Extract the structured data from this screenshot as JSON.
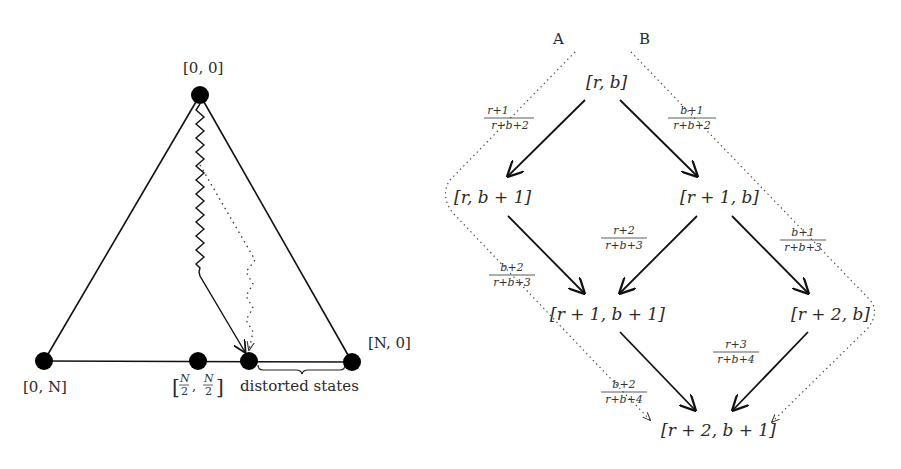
{
  "left_diagram": {
    "title": "Simplex of states",
    "vertices": {
      "top": "[0, 0]",
      "bottom_left": "[0, N]",
      "bottom_right": "[N, 0]",
      "midpoint_num": "N",
      "midpoint_den": "2",
      "midpoint_open": "[",
      "midpoint_comma": ",",
      "midpoint_close": "]"
    },
    "brace_label": "distorted states"
  },
  "right_diagram": {
    "path_labels": {
      "a": "A",
      "b": "B"
    },
    "nodes": {
      "n00": "[r, b]",
      "n01": "[r, b + 1]",
      "n10": "[r + 1, b]",
      "n11": "[r + 1, b + 1]",
      "n20": "[r + 2, b]",
      "n21": "[r + 2, b + 1]"
    },
    "edges": [
      {
        "from": "[r, b]",
        "to": "[r, b + 1]",
        "num": "r+1",
        "den": "r+b+2"
      },
      {
        "from": "[r, b]",
        "to": "[r + 1, b]",
        "num": "b+1",
        "den": "r+b+2"
      },
      {
        "from": "[r + 1, b]",
        "to": "[r + 1, b + 1]",
        "num": "r+2",
        "den": "r+b+3"
      },
      {
        "from": "[r + 1, b]",
        "to": "[r + 2, b]",
        "num": "b+1",
        "den": "r+b+3"
      },
      {
        "from": "[r, b + 1]",
        "to": "[r + 1, b + 1]",
        "num": "b+2",
        "den": "r+b+3"
      },
      {
        "from": "[r + 2, b]",
        "to": "[r + 2, b + 1]",
        "num": "r+3",
        "den": "r+b+4"
      },
      {
        "from": "[r + 1, b + 1]",
        "to": "[r + 2, b + 1]",
        "num": "b+2",
        "den": "r+b+4"
      }
    ]
  }
}
